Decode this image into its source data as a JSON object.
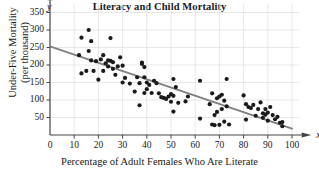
{
  "chart_data": {
    "type": "scatter",
    "title": "Literacy and Child Mortality",
    "xlabel": "Percentage of Adult Females Who Are Literate",
    "ylabel": "Under-Five Mortality (per thousand)",
    "ylabel_line1": "Under-Five Mortality",
    "ylabel_line2": "(per thousand)",
    "x_axis_name": "x",
    "y_axis_name": "y",
    "xlim": [
      0,
      100
    ],
    "ylim": [
      0,
      375
    ],
    "xticks": [
      0,
      10,
      20,
      30,
      40,
      50,
      60,
      70,
      80,
      90,
      100
    ],
    "yticks": [
      50,
      100,
      150,
      200,
      250,
      300,
      350
    ],
    "grid": true,
    "grid_color": "#dedede",
    "marker_color": "#1a1a1a",
    "line_color": "#808080",
    "trend_line": {
      "x0": 0,
      "y0": 253,
      "x1": 100,
      "y1": 18
    },
    "x": [
      12,
      13,
      13,
      15,
      16,
      16,
      17,
      17,
      18,
      19,
      20,
      21,
      22,
      22,
      23,
      24,
      24,
      25,
      25,
      26,
      26,
      27,
      28,
      29,
      30,
      30,
      31,
      33,
      35,
      36,
      37,
      37,
      38,
      38,
      39,
      39,
      39,
      40,
      40,
      41,
      42,
      43,
      44,
      45,
      46,
      47,
      48,
      49,
      50,
      50,
      51,
      51,
      51,
      52,
      53,
      56,
      57,
      62,
      62,
      66,
      67,
      67,
      68,
      68,
      69,
      69,
      70,
      70,
      71,
      71,
      72,
      72,
      73,
      73,
      74,
      80,
      81,
      81,
      82,
      83,
      84,
      85,
      86,
      87,
      88,
      88,
      89,
      89,
      90,
      90,
      91,
      92,
      93,
      94,
      95,
      96,
      96
    ],
    "y": [
      228,
      278,
      176,
      183,
      300,
      240,
      268,
      213,
      183,
      211,
      158,
      216,
      228,
      183,
      205,
      213,
      196,
      277,
      212,
      208,
      189,
      172,
      196,
      222,
      198,
      150,
      163,
      147,
      124,
      165,
      85,
      148,
      207,
      203,
      194,
      165,
      120,
      150,
      131,
      143,
      120,
      155,
      148,
      119,
      108,
      106,
      103,
      110,
      117,
      95,
      160,
      112,
      67,
      137,
      92,
      96,
      110,
      155,
      47,
      88,
      30,
      119,
      57,
      28,
      105,
      66,
      110,
      29,
      115,
      74,
      98,
      38,
      160,
      82,
      30,
      113,
      88,
      44,
      80,
      77,
      86,
      55,
      74,
      93,
      62,
      49,
      74,
      58,
      64,
      41,
      80,
      57,
      45,
      52,
      35,
      25,
      37
    ]
  }
}
